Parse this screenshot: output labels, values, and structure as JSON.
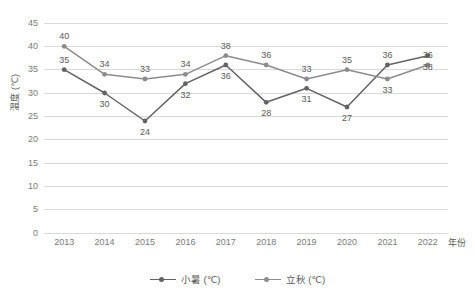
{
  "chart_data": {
    "type": "line",
    "title": "",
    "xlabel": "年份",
    "ylabel": "温度 (℃)",
    "categories": [
      "2013",
      "2014",
      "2015",
      "2016",
      "2017",
      "2018",
      "2019",
      "2020",
      "2021",
      "2022"
    ],
    "ylim": [
      0,
      45
    ],
    "ytick_step": 5,
    "yticks": [
      "0",
      "5",
      "10",
      "15",
      "20",
      "25",
      "30",
      "35",
      "40",
      "45"
    ],
    "grid": "horizontal",
    "legend_position": "bottom-center",
    "show_data_labels": true,
    "series": [
      {
        "name": "小暑 (℃)",
        "color": "#636363",
        "values": [
          35,
          30,
          24,
          32,
          36,
          28,
          31,
          27,
          36,
          38
        ]
      },
      {
        "name": "立秋 (℃)",
        "color": "#8c8c8c",
        "values": [
          40,
          34,
          33,
          34,
          38,
          36,
          33,
          35,
          33,
          36
        ]
      }
    ]
  },
  "colors": {
    "gridline": "#d9d9d9",
    "axis_text": "#7a7a7a",
    "label_text": "#5a5a5a",
    "background": "#ffffff"
  }
}
